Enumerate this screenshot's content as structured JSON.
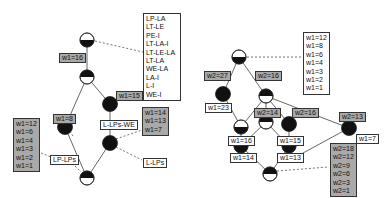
{
  "left_lattice": {
    "intent_box": [
      "LP-LA",
      "LT-LE",
      "PE-I",
      "LT-LA-I",
      "LT-LE-LA",
      "LT-LA",
      "WE-LA",
      "LA-I",
      "L-I",
      "WE-I"
    ],
    "labels": {
      "w1_16": "w1=16",
      "w1_15": "w1=15",
      "w1_8": "w1=8",
      "lp_lps": "LP-LPs",
      "l_lps_we": "L-LPs-WE",
      "l_lps": "L-LPs"
    },
    "extent_left": [
      "w1=12",
      "w1=6",
      "w1=4",
      "w1=3",
      "w1=2",
      "w1=1"
    ],
    "extent_right": [
      "w1=14",
      "w1=13",
      "w1=7"
    ]
  },
  "right_lattice": {
    "top_box": [
      "w1=12",
      "w1=8",
      "w1=6",
      "w1=4",
      "w1=3",
      "w1=2",
      "w1=1"
    ],
    "labels": {
      "w2_27": "w2=27",
      "w1_23": "w1=23",
      "w2_16a": "w2=16",
      "w2_14": "w2=14",
      "w2_16b": "w2=16",
      "w1_16": "w1=16",
      "w1_15": "w1=15",
      "w1_14": "w1=14",
      "w1_13": "w1=13",
      "w2_13": "w2=13",
      "w1_7": "w1=7"
    },
    "bottom_box": [
      "w2=18",
      "w2=12",
      "w2=9",
      "w2=6",
      "w2=3",
      "w2=1"
    ]
  },
  "colors": {
    "node_dark": "#111111",
    "label_gray": "#a9a9a9",
    "edge": "#555555"
  }
}
